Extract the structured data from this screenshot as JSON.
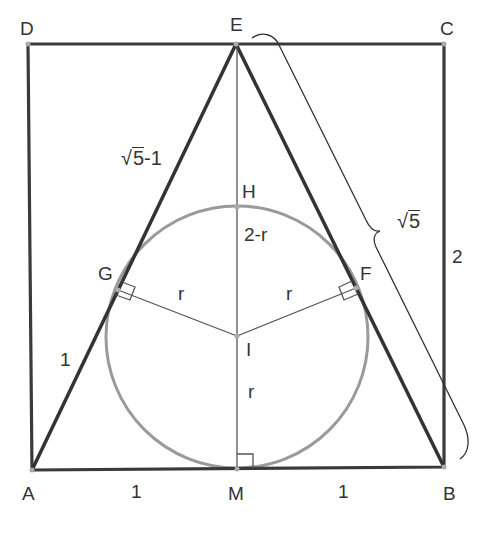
{
  "diagram": {
    "colors": {
      "thick_line": "#3a3a3a",
      "thin_line": "#444444",
      "circle": "#999999",
      "text": "#333333",
      "point": "#aaaaaa"
    },
    "points": [
      {
        "name": "A",
        "x": 32,
        "y": 470
      },
      {
        "name": "B",
        "x": 444,
        "y": 467
      },
      {
        "name": "C",
        "x": 444,
        "y": 44
      },
      {
        "name": "D",
        "x": 28,
        "y": 44
      },
      {
        "name": "E",
        "x": 236,
        "y": 44
      },
      {
        "name": "M",
        "x": 237,
        "y": 469
      },
      {
        "name": "H",
        "x": 237,
        "y": 207
      },
      {
        "name": "I",
        "x": 237,
        "y": 336
      },
      {
        "name": "G",
        "x": 118,
        "y": 290
      },
      {
        "name": "F",
        "x": 356,
        "y": 288
      }
    ],
    "labels": {
      "A": "A",
      "B": "B",
      "C": "C",
      "D": "D",
      "E": "E",
      "M": "M",
      "H": "H",
      "I": "I",
      "G": "G",
      "F": "F"
    },
    "measures": {
      "EG_sqrt_radicand": "5",
      "EG_suffix": "-1",
      "AG": "1",
      "AM": "1",
      "MB": "1",
      "BC": "2",
      "EB_radicand": "5",
      "HI": "2-r",
      "GI": "r",
      "FI": "r",
      "IM": "r"
    },
    "circle": {
      "cx": 237,
      "cy": 337,
      "r": 131
    }
  }
}
